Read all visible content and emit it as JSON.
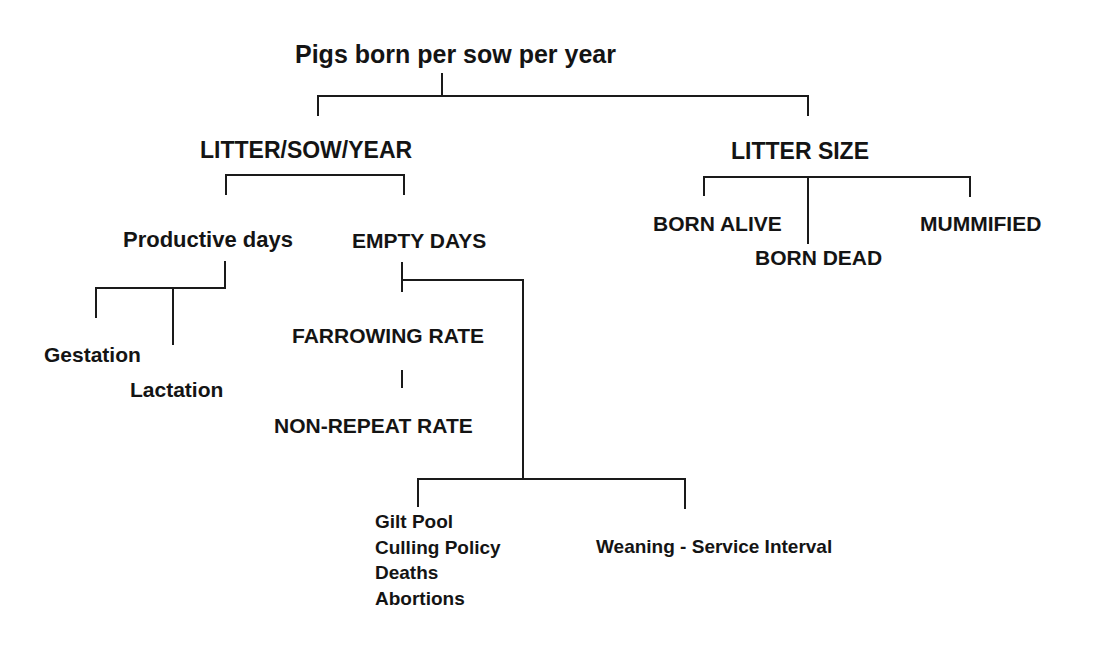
{
  "diagram": {
    "type": "hierarchy-tree",
    "line_color": "#1a1a1a",
    "text_color": "#141414",
    "background": "#ffffff",
    "root": {
      "label": "Pigs born per sow per year"
    },
    "branches": {
      "litter_sow_year": {
        "label": "LITTER/SOW/YEAR",
        "children": {
          "productive_days": {
            "label": "Productive days",
            "children": [
              "Gestation",
              "Lactation"
            ]
          },
          "empty_days": {
            "label": "EMPTY DAYS",
            "children": {
              "farrowing_rate": "FARROWING RATE",
              "non_repeat_rate": "NON-REPEAT RATE",
              "factors": {
                "left_group": [
                  "Gilt Pool",
                  "Culling Policy",
                  "Deaths",
                  "Abortions"
                ],
                "right": "Weaning - Service Interval"
              }
            }
          }
        }
      },
      "litter_size": {
        "label": "LITTER SIZE",
        "children": [
          "BORN ALIVE",
          "BORN DEAD",
          "MUMMIFIED"
        ]
      }
    }
  }
}
